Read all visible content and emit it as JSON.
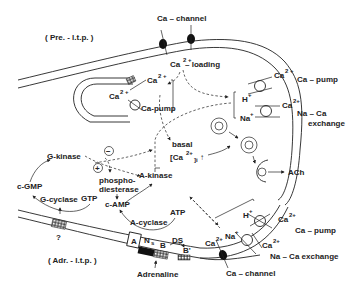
{
  "diagram": {
    "labels": {
      "pre_ltp": "( Pre. - l.t.p. )",
      "adr_ltp": "( Adr. - l.t.p. )",
      "ca_channel_top": "Ca – channel",
      "ca_channel_bottom": "Ca – channel",
      "ca_loading_ca": "Ca",
      "ca_loading_sup": "2 +",
      "ca_loading_text": "– loading",
      "er_ca_out": "Ca",
      "er_ca_out_sup": "2 +",
      "er_ca_in": "Ca",
      "er_ca_in_sup": "2 +",
      "er_ca_pump": "Ca-pump",
      "top_pump_ca": "Ca",
      "top_pump_ca_sup": "2 +",
      "top_pump_label": "Ca – pump",
      "top_h": "H",
      "top_h_sup": "+",
      "top_exch_ca": "Ca",
      "top_exch_ca_sup": "2+",
      "top_exch_label_1": "Na – Ca",
      "top_exch_label_2": "exchange",
      "top_na": "Na",
      "top_na_sup": "+",
      "basal": "basal",
      "basal_ca": "[Ca",
      "basal_ca_sup": "2+",
      "basal_ca_sub": "]i",
      "basal_arrow": "↑",
      "ach": "ACh",
      "g_kinase": "G-kinase",
      "minus": "−",
      "plus": "+",
      "phospho_1": "phospho-",
      "phospho_2": "diesterase",
      "a_kinase": "A-kinase",
      "c_gmp": "c-GMP",
      "c_amp": "c-AMP",
      "g_cyclase": "G-cyclase",
      "gtp": "GTP",
      "a_cyclase": "A-cyclase",
      "atp": "ATP",
      "question": "?",
      "a_box": "A",
      "ns": "N",
      "ns_sub": "s",
      "b": "B",
      "ds": "DS",
      "b_prime": "B'",
      "adrenaline": "Adrenaline",
      "bot_h": "H",
      "bot_h_sup": "+",
      "bot_pump_ca": "Ca",
      "bot_pump_ca_sup": "2+",
      "bot_pump_label": "Ca – pump",
      "bot_ca": "Ca",
      "bot_ca_sup": "2+",
      "bot_na": "Na",
      "bot_na_sup": "+",
      "bot_exch_ca": "Ca",
      "bot_exch_ca_sup": "2+",
      "bot_exch_label": "Na – Ca exchange"
    }
  }
}
